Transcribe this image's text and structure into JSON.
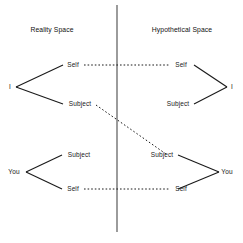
{
  "figure": {
    "type": "conceptual-diagram",
    "background_color": "#ffffff",
    "line_color": "#1a1a1a",
    "divider": {
      "name": "vertical-divider",
      "x": 117,
      "y_top": 5,
      "y_bottom": 232
    }
  },
  "titles": {
    "left": "Reality Space",
    "right": "Hypothetical Space"
  },
  "groups": [
    {
      "id": "reality-upper",
      "space": "Reality Space",
      "apex_label": "I",
      "apex_side": "left",
      "top_label": "Self",
      "bottom_label": "Subject"
    },
    {
      "id": "hypothetical-upper",
      "space": "Hypothetical Space",
      "apex_label": "I",
      "apex_side": "right",
      "top_label": "Self",
      "bottom_label": "Subject"
    },
    {
      "id": "reality-lower",
      "space": "Reality Space",
      "apex_label": "You",
      "apex_side": "left",
      "top_label": "Subject",
      "bottom_label": "Self"
    },
    {
      "id": "hypothetical-lower",
      "space": "Hypothetical Space",
      "apex_label": "You",
      "apex_side": "right",
      "top_label": "Subject",
      "bottom_label": "Self"
    }
  ],
  "labels": {
    "reality_upper_apex": "I",
    "reality_upper_top": "Self",
    "reality_upper_bottom": "Subject",
    "hypothetical_upper_apex": "I",
    "hypothetical_upper_top": "Self",
    "hypothetical_upper_bottom": "Subject",
    "reality_lower_apex": "You",
    "reality_lower_top": "Subject",
    "reality_lower_bottom": "Self",
    "hypothetical_lower_apex": "You",
    "hypothetical_lower_top": "Subject",
    "hypothetical_lower_bottom": "Self"
  },
  "connectors": [
    {
      "name": "self-to-self-upper",
      "style": "dotted",
      "from": "reality_upper_top",
      "to": "hypothetical_upper_top"
    },
    {
      "name": "subject-to-subject-diagonal",
      "style": "dotted",
      "from": "reality_upper_bottom",
      "to": "hypothetical_lower_top"
    },
    {
      "name": "self-to-self-lower",
      "style": "dotted",
      "from": "reality_lower_bottom",
      "to": "hypothetical_lower_bottom"
    }
  ]
}
